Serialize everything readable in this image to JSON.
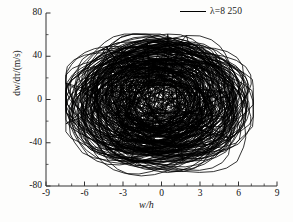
{
  "figure": {
    "background_color": "#fdfdfc",
    "line_color": "#000000"
  },
  "legend": {
    "swatch_name": "legend-line-swatch",
    "label": "λ=8 250"
  },
  "axes": {
    "x_title_num": "w",
    "x_title_sep": "/",
    "x_title_den": "h",
    "y_title": "dw/dτ/(m/s)",
    "x_ticks": [
      "-9",
      "-6",
      "-3",
      "0",
      "3",
      "6",
      "9"
    ],
    "y_ticks": [
      "80",
      "40",
      "0",
      "-40",
      "-80"
    ]
  },
  "chart_data": {
    "type": "line",
    "title": "",
    "xlabel": "w/h",
    "ylabel": "dw/dτ/(m/s)",
    "xlim": [
      -9,
      9
    ],
    "ylim": [
      -80,
      80
    ],
    "xticks": [
      -9,
      -6,
      -3,
      0,
      3,
      6,
      9
    ],
    "yticks": [
      -80,
      -40,
      0,
      40,
      80
    ],
    "x_minor_tick_step": 1,
    "y_minor_tick_step": 20,
    "grid": false,
    "legend_position": "top-right",
    "series": [
      {
        "name": "λ=8 250",
        "description": "Chaotic phase portrait trajectory (strange attractor), dense multi-loop orbit centred near the origin",
        "color": "#000000",
        "line_width": 0.8,
        "data_extent": {
          "x_min": -7.4,
          "x_max": 7.1,
          "y_min": -78,
          "y_max": 60
        },
        "attractor_params": {
          "loops": 150,
          "radius_x_min": 1.1,
          "radius_x_max": 6.9,
          "radius_y_min": 10,
          "radius_y_max": 56,
          "center_x": -0.25,
          "center_y": -2,
          "chaos_amplitude": 0.55,
          "seed": 20250
        },
        "comment": "Individual orbit vertices are not resolvable at this resolution; the attractor is reconstructed from the listed envelope and loop statistics."
      }
    ]
  }
}
